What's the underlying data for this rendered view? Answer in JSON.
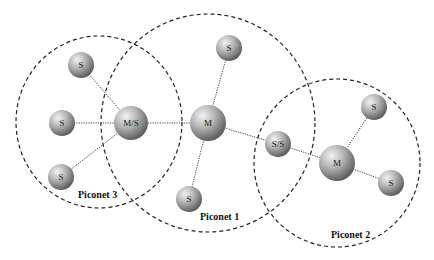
{
  "diagram": {
    "type": "bluetooth-scatternet",
    "piconets": [
      {
        "id": "p3",
        "label": "Piconet 3",
        "cx": 99,
        "cy": 122,
        "rx": 83,
        "ry": 86,
        "label_x": 78,
        "label_y": 198
      },
      {
        "id": "p1",
        "label": "Piconet 1",
        "cx": 208,
        "cy": 123,
        "rx": 107,
        "ry": 109,
        "label_x": 200,
        "label_y": 220
      },
      {
        "id": "p2",
        "label": "Piconet 2",
        "cx": 337,
        "cy": 163,
        "rx": 83,
        "ry": 84,
        "label_x": 331,
        "label_y": 238
      }
    ],
    "nodes": [
      {
        "id": "s1",
        "label": "S",
        "role": "slave",
        "x": 81,
        "y": 65,
        "r": 13
      },
      {
        "id": "s2",
        "label": "S",
        "role": "slave",
        "x": 62,
        "y": 123,
        "r": 13
      },
      {
        "id": "s3",
        "label": "S",
        "role": "slave",
        "x": 61,
        "y": 177,
        "r": 13
      },
      {
        "id": "ms",
        "label": "M/S",
        "role": "master-slave bridge",
        "x": 131,
        "y": 123,
        "r": 17
      },
      {
        "id": "m1",
        "label": "M",
        "role": "master",
        "x": 208,
        "y": 123,
        "r": 18
      },
      {
        "id": "s4",
        "label": "S",
        "role": "slave",
        "x": 229,
        "y": 48,
        "r": 13
      },
      {
        "id": "s5",
        "label": "S",
        "role": "slave",
        "x": 189,
        "y": 199,
        "r": 13
      },
      {
        "id": "ss",
        "label": "S/S",
        "role": "slave-slave bridge",
        "x": 278,
        "y": 144,
        "r": 13
      },
      {
        "id": "m2",
        "label": "M",
        "role": "master",
        "x": 337,
        "y": 163,
        "r": 18
      },
      {
        "id": "s6",
        "label": "S",
        "role": "slave",
        "x": 374,
        "y": 107,
        "r": 13
      },
      {
        "id": "s7",
        "label": "S",
        "role": "slave",
        "x": 391,
        "y": 183,
        "r": 13
      }
    ],
    "links": [
      [
        "s1",
        "ms"
      ],
      [
        "s2",
        "ms"
      ],
      [
        "s3",
        "ms"
      ],
      [
        "ms",
        "m1"
      ],
      [
        "m1",
        "s4"
      ],
      [
        "m1",
        "s5"
      ],
      [
        "m1",
        "ss"
      ],
      [
        "ss",
        "m2"
      ],
      [
        "m2",
        "s6"
      ],
      [
        "m2",
        "s7"
      ]
    ],
    "colors": {
      "background": "#ffffff",
      "node_light": "#e6e6e6",
      "node_mid": "#a8a8a8",
      "node_dark": "#5c5c5c",
      "ring": "#222222",
      "link": "#444444",
      "text": "#111111"
    }
  }
}
